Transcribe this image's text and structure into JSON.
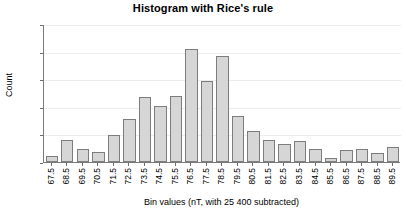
{
  "chart_data": {
    "type": "bar",
    "title": "Histogram with Rice's rule",
    "xlabel": "Bin values (nT, with 25 400 subtracted)",
    "ylabel": "Count",
    "categories": [
      "67.5",
      "68.5",
      "69.5",
      "70.5",
      "71.5",
      "72.5",
      "73.5",
      "74.5",
      "75.5",
      "76.5",
      "77.5",
      "78.5",
      "79.5",
      "80.5",
      "81.5",
      "82.5",
      "83.5",
      "84.5",
      "85.5",
      "86.5",
      "87.5",
      "88.5",
      "89.5"
    ],
    "values": [
      10,
      40,
      24,
      18,
      49,
      78,
      118,
      101,
      120,
      205,
      147,
      192,
      84,
      57,
      40,
      32,
      38,
      23,
      7,
      21,
      24,
      16,
      28
    ],
    "ylim": [
      0,
      250
    ],
    "yticks": [
      0,
      50,
      100,
      150,
      200,
      250
    ],
    "ytick_labels": [
      "0",
      "50",
      "100",
      "150",
      "200",
      "250"
    ],
    "grid": true,
    "legend": false,
    "bar_fill_color": "#d6d6d6",
    "bar_edge_color": "#7d7d7d",
    "axis_color": "#7a7a7a",
    "grid_color": "#ededed",
    "text_color": "#000000"
  }
}
